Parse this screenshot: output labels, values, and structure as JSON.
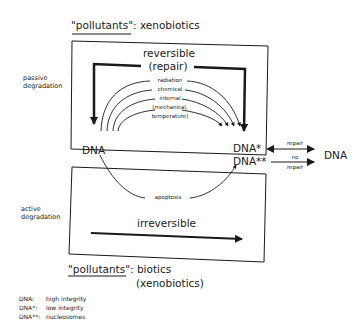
{
  "top": {
    "pollutants_label": "\"pollutants\"",
    "pollutants_value": ": xenobiotics"
  },
  "upper_box": {
    "title_line1": "reversible",
    "title_line2": "(repair)",
    "side_label_line1": "passive",
    "side_label_line2": "degradation",
    "arcs": [
      "radiation",
      "chemical",
      "internal",
      "(mechanical,",
      "temperature)"
    ]
  },
  "middle": {
    "dna_left": "DNA",
    "dna_star": "DNA*",
    "dna_double_star": "DNA**",
    "repair_label": "repair",
    "no_repair_line1": "no",
    "no_repair_line2": "repair",
    "dna_right": "DNA",
    "apoptosis_label": "apoptosis"
  },
  "lower_box": {
    "side_label_line1": "active",
    "side_label_line2": "degradation",
    "arrow_label": "irreversible"
  },
  "bottom": {
    "pollutants_label": "\"pollutants\"",
    "pollutants_value_line1": ": biotics",
    "pollutants_value_line2": "(xenobiotics)"
  },
  "legend": [
    {
      "key": "DNA:",
      "value": "high integrity"
    },
    {
      "key": "DNA*:",
      "value": "low integrity"
    },
    {
      "key": "DNA**:",
      "value": "nucleosomes"
    }
  ]
}
